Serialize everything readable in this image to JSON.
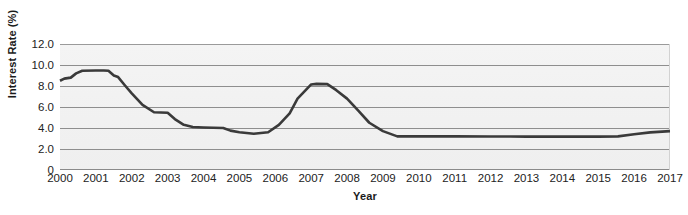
{
  "chart_data": {
    "type": "line",
    "title": "",
    "xlabel": "Year",
    "ylabel": "Interest Rate (%)",
    "xlim": [
      2000,
      2017
    ],
    "ylim": [
      0,
      12
    ],
    "y_ticks": [
      "0",
      "2.0",
      "4.0",
      "6.0",
      "8.0",
      "10.0",
      "12.0"
    ],
    "y_tick_values": [
      0,
      2,
      4,
      6,
      8,
      10,
      12
    ],
    "x_ticks": [
      "2000",
      "2001",
      "2002",
      "2003",
      "2004",
      "2005",
      "2006",
      "2007",
      "2008",
      "2009",
      "2010",
      "2011",
      "2012",
      "2013",
      "2014",
      "2015",
      "2016",
      "2017"
    ],
    "grid": true,
    "legend_position": "none",
    "series": [
      {
        "name": "Interest Rate",
        "color": "#3a3a3a",
        "x": [
          2000.0,
          2000.12,
          2000.3,
          2000.45,
          2000.62,
          2001.0,
          2001.22,
          2001.35,
          2001.5,
          2001.62,
          2001.8,
          2002.0,
          2002.3,
          2002.62,
          2003.0,
          2003.2,
          2003.45,
          2003.7,
          2004.0,
          2004.55,
          2004.75,
          2005.0,
          2005.4,
          2005.8,
          2006.1,
          2006.4,
          2006.62,
          2007.0,
          2007.15,
          2007.45,
          2007.7,
          2008.0,
          2008.3,
          2008.62,
          2009.0,
          2009.4,
          2010.0,
          2011.0,
          2012.0,
          2013.0,
          2014.0,
          2015.0,
          2015.55,
          2016.0,
          2016.45,
          2017.0
        ],
        "y": [
          8.5,
          8.7,
          8.8,
          9.2,
          9.45,
          9.48,
          9.48,
          9.45,
          9.0,
          8.85,
          8.1,
          7.3,
          6.2,
          5.5,
          5.45,
          4.85,
          4.3,
          4.1,
          4.05,
          4.0,
          3.75,
          3.6,
          3.45,
          3.6,
          4.3,
          5.4,
          6.8,
          8.15,
          8.2,
          8.18,
          7.6,
          6.8,
          5.7,
          4.5,
          3.7,
          3.2,
          3.2,
          3.2,
          3.19,
          3.18,
          3.18,
          3.18,
          3.2,
          3.4,
          3.58,
          3.7
        ]
      }
    ]
  },
  "figure": {
    "y_axis_title": "Interest Rate (%)",
    "x_axis_title": "Year",
    "watermark": ""
  }
}
